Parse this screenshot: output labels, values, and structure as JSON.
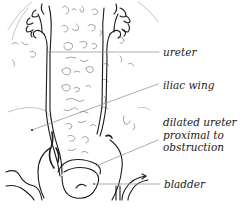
{
  "diagram": {
    "labels": {
      "ureter": "ureter",
      "iliac_wing": "iliac wing",
      "dilated_ureter": [
        "dilated ureter",
        "proximal to",
        "obstruction"
      ],
      "bladder": "bladder"
    },
    "colors": {
      "ink": "#1a1a1a",
      "faint_ink": "#9a9a9a",
      "leader_line": "#8a8a8a",
      "background": "#ffffff"
    }
  }
}
